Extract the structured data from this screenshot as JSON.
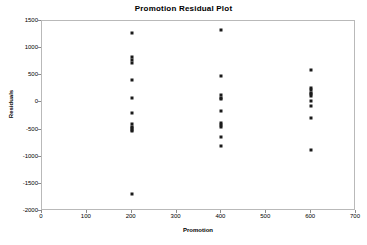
{
  "chart_data": {
    "type": "scatter",
    "title": "Promotion  Residual Plot",
    "xlabel": "Promotion",
    "ylabel": "Residuals",
    "xlim": [
      0,
      700
    ],
    "ylim": [
      -2000,
      1500
    ],
    "xticks": [
      0,
      100,
      200,
      300,
      400,
      500,
      600,
      700
    ],
    "yticks": [
      1500,
      1000,
      500,
      0,
      -500,
      -1000,
      -1500,
      -2000
    ],
    "grid": false,
    "legend": "none",
    "marker_color": "#1a1a1a",
    "frame_color": "#b9b9b9",
    "points": [
      {
        "x": 200,
        "y": 1270
      },
      {
        "x": 200,
        "y": 840
      },
      {
        "x": 200,
        "y": 780
      },
      {
        "x": 200,
        "y": 730
      },
      {
        "x": 200,
        "y": 420
      },
      {
        "x": 200,
        "y": 90
      },
      {
        "x": 200,
        "y": -200
      },
      {
        "x": 200,
        "y": -390
      },
      {
        "x": 200,
        "y": -450
      },
      {
        "x": 200,
        "y": -470
      },
      {
        "x": 200,
        "y": -500
      },
      {
        "x": 200,
        "y": -520
      },
      {
        "x": 200,
        "y": -1680
      },
      {
        "x": 400,
        "y": 1330
      },
      {
        "x": 400,
        "y": 480
      },
      {
        "x": 400,
        "y": 130
      },
      {
        "x": 400,
        "y": 90
      },
      {
        "x": 400,
        "y": 70
      },
      {
        "x": 400,
        "y": -150
      },
      {
        "x": 400,
        "y": -380
      },
      {
        "x": 400,
        "y": -420
      },
      {
        "x": 400,
        "y": -450
      },
      {
        "x": 400,
        "y": -640
      },
      {
        "x": 400,
        "y": -800
      },
      {
        "x": 600,
        "y": 600
      },
      {
        "x": 600,
        "y": 260
      },
      {
        "x": 600,
        "y": 220
      },
      {
        "x": 600,
        "y": 180
      },
      {
        "x": 600,
        "y": 150
      },
      {
        "x": 600,
        "y": 120
      },
      {
        "x": 600,
        "y": 20
      },
      {
        "x": 600,
        "y": -60
      },
      {
        "x": 600,
        "y": -280
      },
      {
        "x": 600,
        "y": -880
      }
    ]
  }
}
